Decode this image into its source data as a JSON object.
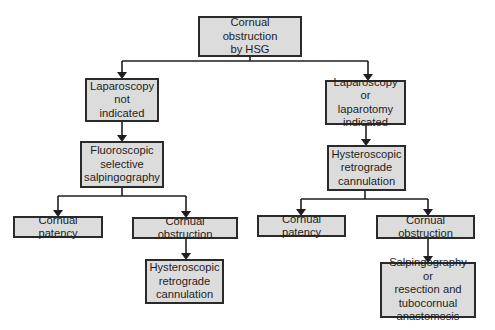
{
  "diagram": {
    "type": "flowchart",
    "colors": {
      "box_fill": "#dcdcdc",
      "box_border": "#2a2a2a",
      "line": "#1e1e1e",
      "text": "#1e1e1e",
      "background": "#ffffff"
    },
    "nodes": {
      "root": {
        "label": "Cornual obstruction\nby HSG"
      },
      "left_1": {
        "label": "Laparoscopy\nnot\nindicated"
      },
      "left_2": {
        "label": "Fluoroscopic\nselective\nsalpingography"
      },
      "left_3a": {
        "label": "Cornual patency"
      },
      "left_3b": {
        "label": "Cornual obstruction"
      },
      "left_4": {
        "label": "Hysteroscopic\nretrograde\ncannulation"
      },
      "right_1": {
        "label": "Laparoscopy or\nlaparotomy\nindicated"
      },
      "right_2": {
        "label": "Hysteroscopic\nretrograde\ncannulation"
      },
      "right_3a": {
        "label": "Cornual patency"
      },
      "right_3b": {
        "label": "Cornual obstruction"
      },
      "right_4": {
        "label": "Salpingography or\nresection and\ntubocornual\nanastomosis"
      }
    },
    "edges": [
      {
        "from": "root",
        "to": "left_1"
      },
      {
        "from": "root",
        "to": "right_1"
      },
      {
        "from": "left_1",
        "to": "left_2"
      },
      {
        "from": "left_2",
        "to": "left_3a"
      },
      {
        "from": "left_2",
        "to": "left_3b"
      },
      {
        "from": "left_3b",
        "to": "left_4"
      },
      {
        "from": "right_1",
        "to": "right_2"
      },
      {
        "from": "right_2",
        "to": "right_3a"
      },
      {
        "from": "right_2",
        "to": "right_3b"
      },
      {
        "from": "right_3b",
        "to": "right_4"
      }
    ]
  }
}
